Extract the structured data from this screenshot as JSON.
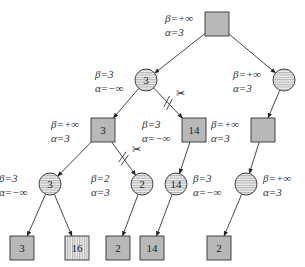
{
  "diagram": {
    "colors": {
      "max_node_fill": "#b8b8b8",
      "min_node_fill": "#e8e8e8",
      "stroke": "#333333",
      "hatch": "#777777"
    },
    "nodes": [
      {
        "id": "root",
        "shape": "square",
        "fill": "solid",
        "value": "",
        "beta": "β=+∞",
        "alpha": "α=3",
        "label_side": "left"
      },
      {
        "id": "n1",
        "shape": "circle",
        "fill": "horizontal-hatch",
        "value": "3",
        "beta": "β=3",
        "alpha": "α=−∞",
        "label_side": "left"
      },
      {
        "id": "n2",
        "shape": "circle",
        "fill": "horizontal-hatch",
        "value": "",
        "beta": "β=+∞",
        "alpha": "α=3",
        "label_side": "left"
      },
      {
        "id": "n3",
        "shape": "square",
        "fill": "solid",
        "value": "3",
        "beta": "β=+∞",
        "alpha": "α=3",
        "label_side": "left"
      },
      {
        "id": "n4",
        "shape": "square",
        "fill": "solid",
        "value": "14",
        "beta": "β=3",
        "alpha": "α=−∞",
        "label_side": "left"
      },
      {
        "id": "n5",
        "shape": "square",
        "fill": "solid",
        "value": "",
        "beta": "β=+∞",
        "alpha": "α=3",
        "label_side": "left"
      },
      {
        "id": "n6",
        "shape": "circle",
        "fill": "horizontal-hatch",
        "value": "3",
        "beta": "β=3",
        "alpha": "α=−∞",
        "label_side": "left"
      },
      {
        "id": "n7",
        "shape": "circle",
        "fill": "horizontal-hatch",
        "value": "2",
        "beta": "β=2",
        "alpha": "α=3",
        "label_side": "left"
      },
      {
        "id": "n8",
        "shape": "circle",
        "fill": "horizontal-hatch",
        "value": "14",
        "beta": "β=3",
        "alpha": "α=−∞",
        "label_side": "right"
      },
      {
        "id": "n9",
        "shape": "circle",
        "fill": "horizontal-hatch",
        "value": "",
        "beta": "β=+∞",
        "alpha": "α=3",
        "label_side": "right"
      },
      {
        "id": "l1",
        "shape": "square",
        "fill": "solid",
        "value": "3",
        "beta": "",
        "alpha": ""
      },
      {
        "id": "l2",
        "shape": "square",
        "fill": "vertical-hatch",
        "value": "16",
        "beta": "",
        "alpha": ""
      },
      {
        "id": "l3",
        "shape": "square",
        "fill": "solid",
        "value": "2",
        "beta": "",
        "alpha": ""
      },
      {
        "id": "l4",
        "shape": "square",
        "fill": "solid",
        "value": "14",
        "beta": "",
        "alpha": ""
      },
      {
        "id": "l5",
        "shape": "square",
        "fill": "solid",
        "value": "2",
        "beta": "",
        "alpha": ""
      }
    ],
    "edges": [
      {
        "from": "root",
        "to": "n1",
        "pruned": false
      },
      {
        "from": "root",
        "to": "n2",
        "pruned": false
      },
      {
        "from": "n1",
        "to": "n3",
        "pruned": false
      },
      {
        "from": "n1",
        "to": "n4",
        "pruned": true,
        "mark": "✂"
      },
      {
        "from": "n2",
        "to": "n5",
        "pruned": false
      },
      {
        "from": "n3",
        "to": "n6",
        "pruned": false
      },
      {
        "from": "n3",
        "to": "n7",
        "pruned": true,
        "mark": "✂"
      },
      {
        "from": "n4",
        "to": "n8",
        "pruned": false
      },
      {
        "from": "n5",
        "to": "n9",
        "pruned": false
      },
      {
        "from": "n6",
        "to": "l1",
        "pruned": false
      },
      {
        "from": "n6",
        "to": "l2",
        "pruned": false
      },
      {
        "from": "n7",
        "to": "l3",
        "pruned": false
      },
      {
        "from": "n8",
        "to": "l4",
        "pruned": false
      },
      {
        "from": "n9",
        "to": "l5",
        "pruned": false
      }
    ]
  }
}
